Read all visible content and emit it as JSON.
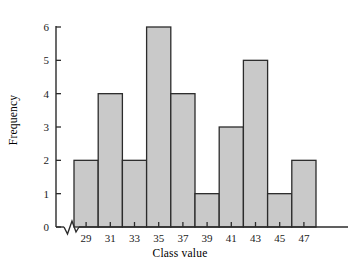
{
  "chart_data": {
    "type": "bar",
    "title": "",
    "subtitle": "",
    "xlabel": "Class value",
    "ylabel": "Frequency",
    "categories": [
      "29",
      "31",
      "33",
      "35",
      "37",
      "39",
      "41",
      "43",
      "45",
      "47"
    ],
    "values": [
      2,
      4,
      2,
      6,
      4,
      1,
      3,
      5,
      1,
      2
    ],
    "ylim": [
      0,
      6
    ],
    "ytick_labels": [
      "0",
      "1",
      "2",
      "3",
      "4",
      "5",
      "6"
    ],
    "ytick_values": [
      0,
      1,
      2,
      3,
      4,
      5,
      6
    ],
    "grid": false,
    "legend": null,
    "legend_position": "none",
    "bar_fill_color": "#c9c9c9",
    "bar_edge_color": "#2b2b2b",
    "axis_color": "#2b2b2b",
    "background_color": "#ffffff",
    "axis_break": "x-axis zigzag break between origin and first bar",
    "annotations": []
  },
  "axes": {
    "y_axis_name": "frequency-axis",
    "x_axis_name": "class-value-axis"
  }
}
